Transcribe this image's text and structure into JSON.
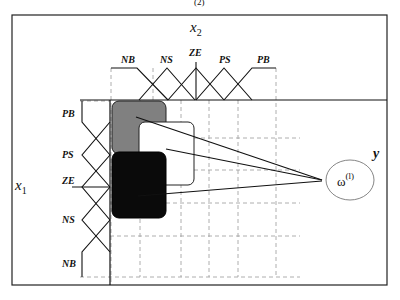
{
  "diagram": {
    "top_fragment": "(2)",
    "x2_axis": {
      "label": "x",
      "subscript": "2",
      "membership_functions": [
        "NB",
        "NS",
        "ZE",
        "PS",
        "PB"
      ]
    },
    "x1_axis": {
      "label": "x",
      "subscript": "1",
      "membership_functions": [
        "PB",
        "PS",
        "ZE",
        "NS",
        "NB"
      ]
    },
    "output": {
      "label": "y",
      "node_symbol": "ω",
      "node_superscript": "(l)"
    },
    "rule_cells": [
      {
        "name": "gray-rule-cell",
        "fill": "#808080"
      },
      {
        "name": "white-rule-cell",
        "fill": "#ffffff"
      },
      {
        "name": "black-rule-cell",
        "fill": "#0a0a0a"
      }
    ],
    "colors": {
      "line": "#111111",
      "grid": "#9a9a9a",
      "gray_cell": "#808080",
      "black_cell": "#0a0a0a"
    }
  }
}
